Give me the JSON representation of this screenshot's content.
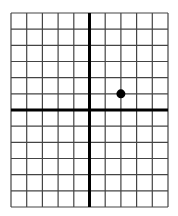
{
  "chart_data": {
    "type": "scatter",
    "title": "",
    "xlabel": "",
    "ylabel": "",
    "grid": true,
    "xlim": [
      -5,
      5
    ],
    "ylim": [
      -6,
      6
    ],
    "x_step": 1,
    "y_step": 1,
    "points": [
      {
        "x": 2,
        "y": 1
      }
    ],
    "legend": null
  },
  "style": {
    "grid_color": "#444444",
    "axis_color": "#000000",
    "point_color": "#000000",
    "background": "#ffffff"
  },
  "layout": {
    "left": 11,
    "top": 13,
    "right": 168,
    "bottom": 207
  }
}
